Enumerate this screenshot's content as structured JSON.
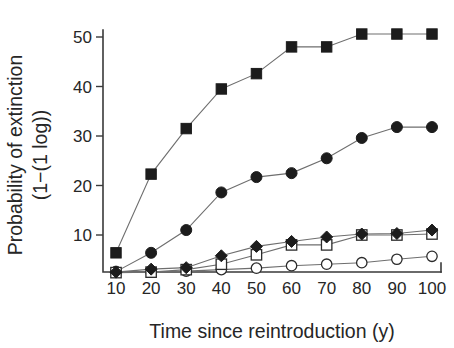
{
  "chart_data": {
    "type": "line",
    "title": "",
    "xlabel": "Time since reintroduction (y)",
    "ylabel": "Probability of extinction (1−(1 log))",
    "ylabel_line1": "Probability of extinction",
    "ylabel_line2": "(1−(1 log))",
    "x": [
      10,
      20,
      30,
      40,
      50,
      60,
      70,
      80,
      90,
      100
    ],
    "xlim": [
      5,
      105
    ],
    "ylim": [
      2.3,
      52.5
    ],
    "xticks": [
      10,
      20,
      30,
      40,
      50,
      60,
      70,
      80,
      90,
      100
    ],
    "xtick_labels": [
      "10",
      "20",
      "30",
      "40",
      "50",
      "60",
      "70",
      "80",
      "90",
      "100"
    ],
    "yticks": [
      10,
      20,
      30,
      40,
      50
    ],
    "ytick_labels": [
      "10",
      "20",
      "30",
      "40",
      "50"
    ],
    "grid": false,
    "legend": "none",
    "line_color": "#6e6e6e",
    "series": [
      {
        "name": "filled-square",
        "marker": "square-filled",
        "color": "#1c1c1c",
        "values": [
          6.4,
          22.3,
          31.5,
          39.5,
          42.6,
          48.0,
          48.0,
          50.6,
          50.6,
          50.6
        ]
      },
      {
        "name": "filled-circle",
        "marker": "circle-filled",
        "color": "#1c1c1c",
        "values": [
          2.6,
          6.4,
          11.0,
          18.6,
          21.7,
          22.5,
          25.5,
          29.6,
          31.8,
          31.8
        ]
      },
      {
        "name": "filled-diamond",
        "marker": "diamond-filled",
        "color": "#1c1c1c",
        "values": [
          2.5,
          3.1,
          3.4,
          5.8,
          7.7,
          8.7,
          9.6,
          10.2,
          10.3,
          11.0
        ]
      },
      {
        "name": "open-square",
        "marker": "square-open",
        "color": "#2b2b2b",
        "values": [
          2.4,
          2.5,
          3.0,
          4.1,
          6.0,
          8.0,
          8.0,
          10.0,
          10.0,
          10.2
        ]
      },
      {
        "name": "open-circle",
        "marker": "circle-open",
        "color": "#2b2b2b",
        "values": [
          2.5,
          2.5,
          2.7,
          3.0,
          3.3,
          3.8,
          4.1,
          4.4,
          5.1,
          5.7
        ]
      }
    ]
  }
}
